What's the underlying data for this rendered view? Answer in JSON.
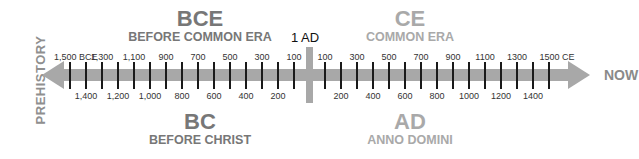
{
  "left_label": "PREHISTORY",
  "right_label": "NOW",
  "center_label": "1 AD",
  "top": {
    "bce_title": "BCE",
    "bce_subtitle": "BEFORE COMMON ERA",
    "ce_title": "CE",
    "ce_subtitle": "COMMON ERA"
  },
  "bottom": {
    "bc_title": "BC",
    "bc_subtitle": "BEFORE CHRIST",
    "ad_title": "AD",
    "ad_subtitle": "ANNO DOMINI"
  },
  "colors": {
    "dark_era": "#777777",
    "light_era": "#a9a9a9",
    "arrow": "#a8a8a8",
    "tick": "#1a1a1a"
  },
  "bce_ticks": {
    "top": [
      "1,500 BCE",
      "1,300",
      "1,100",
      "900",
      "700",
      "500",
      "300",
      "100"
    ],
    "bottom": [
      "1,400",
      "1,200",
      "1,000",
      "800",
      "600",
      "400",
      "200"
    ]
  },
  "ce_ticks": {
    "top": [
      "100",
      "300",
      "500",
      "700",
      "900",
      "1100",
      "1300",
      "1500 CE"
    ],
    "bottom": [
      "200",
      "400",
      "600",
      "800",
      "1000",
      "1200",
      "1400"
    ]
  }
}
